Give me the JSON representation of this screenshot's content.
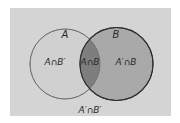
{
  "diagram": {
    "type": "venn",
    "colors": {
      "background": "#d4d4d4",
      "set_a_fill": "#d0d0d0",
      "set_a_stroke": "#8a8a8a",
      "set_b_fill": "#a9a9a9",
      "set_b_stroke": "#2e2e2e",
      "intersection_fill": "#7e7e7e"
    },
    "sets": [
      {
        "name": "A",
        "label": "A"
      },
      {
        "name": "B",
        "label": "B"
      }
    ],
    "regions": {
      "a_only": "A∩B′",
      "intersection": "A∩B",
      "b_only": "A′∩B",
      "neither": "A′∩B′"
    }
  }
}
